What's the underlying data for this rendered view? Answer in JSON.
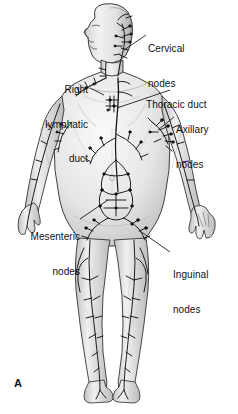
{
  "figure": {
    "panel_letter": "A",
    "background_color": "#ffffff",
    "ink_color": "#1a1a1a",
    "skin_shade": "#e8e8e8"
  },
  "labels": {
    "cervical": {
      "line1": "Cervical",
      "line2": "nodes"
    },
    "right_lymphatic": {
      "line1": "Right",
      "line2": "lymphatic",
      "line3": "duct"
    },
    "thoracic": {
      "line1": "Thoracic duct"
    },
    "axillary": {
      "line1": "Axillary",
      "line2": "nodes"
    },
    "mesenteric": {
      "line1": "Mesenteric",
      "line2": "nodes"
    },
    "inguinal": {
      "line1": "Inguinal",
      "line2": "nodes"
    }
  }
}
